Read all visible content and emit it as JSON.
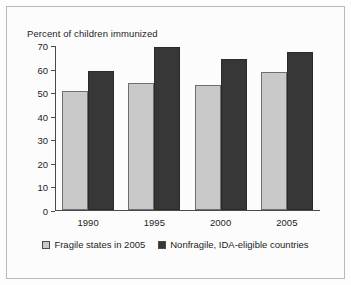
{
  "chart_data": {
    "type": "bar",
    "title": "Percent of children immunized",
    "xlabel": "",
    "ylabel": "",
    "categories": [
      "1990",
      "1995",
      "2000",
      "2005"
    ],
    "series": [
      {
        "name": "Fragile states in 2005",
        "color": "#c9c9c9",
        "values": [
          50.5,
          54,
          53,
          58.5
        ]
      },
      {
        "name": "Nonfragile, IDA-eligible countries",
        "color": "#373737",
        "values": [
          59,
          69,
          64,
          67
        ]
      }
    ],
    "ylim": [
      0,
      70
    ],
    "yticks": [
      "0",
      "10",
      "20",
      "30",
      "40",
      "50",
      "60",
      "70"
    ],
    "grid": false,
    "legend_position": "bottom"
  },
  "legend": {
    "entries": [
      {
        "label": "Fragile states in 2005",
        "swatch": "light-swatch-icon"
      },
      {
        "label": "Nonfragile, IDA-eligible countries",
        "swatch": "dark-swatch-icon"
      }
    ]
  }
}
